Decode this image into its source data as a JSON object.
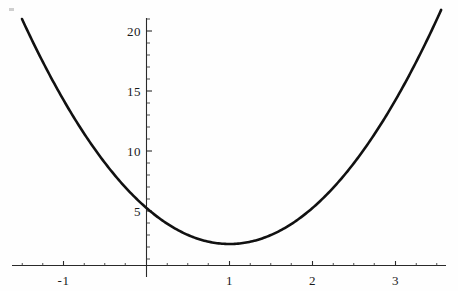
{
  "figure": {
    "kind": "mathematica-plot",
    "background_color": "#fefefe",
    "curve_color": "#111111",
    "axis_color": "#2a2a2a",
    "label_color": "#1a1a1a"
  },
  "chart_data": {
    "type": "line",
    "title": "",
    "subtitle": "",
    "xlabel": "",
    "ylabel": "",
    "xlim": [
      -1.5,
      3.55
    ],
    "ylim": [
      0,
      21.5
    ],
    "grid": false,
    "legend": null,
    "annotations": [],
    "x_ticks": [
      -1,
      1,
      2,
      3
    ],
    "x_tick_labels": [
      "-1",
      "1",
      "2",
      "3"
    ],
    "x_minor_tick_step": 0.25,
    "y_ticks": [
      5,
      10,
      15,
      20
    ],
    "y_tick_labels": [
      "5",
      "10",
      "15",
      "20"
    ],
    "y_minor_tick_step": 1,
    "axis_origin": {
      "x": 0,
      "y": 0
    },
    "series": [
      {
        "name": "parabola",
        "expression": "3*(x - 1)^2 + 2.25",
        "vertex": {
          "x": 1,
          "y": 2.25
        },
        "y_intercept": 5.25,
        "x": [
          -1.5,
          -1.25,
          -1,
          -0.75,
          -0.5,
          -0.25,
          0,
          0.25,
          0.5,
          0.75,
          1,
          1.25,
          1.5,
          1.75,
          2,
          2.25,
          2.5,
          2.75,
          3,
          3.25,
          3.55
        ],
        "values": [
          21,
          19.14,
          14.25,
          11.44,
          9,
          6.94,
          5.25,
          3.94,
          3,
          2.44,
          2.25,
          2.44,
          3,
          3.94,
          5.25,
          6.94,
          9,
          11.44,
          14.25,
          19.14,
          21
        ]
      }
    ]
  }
}
